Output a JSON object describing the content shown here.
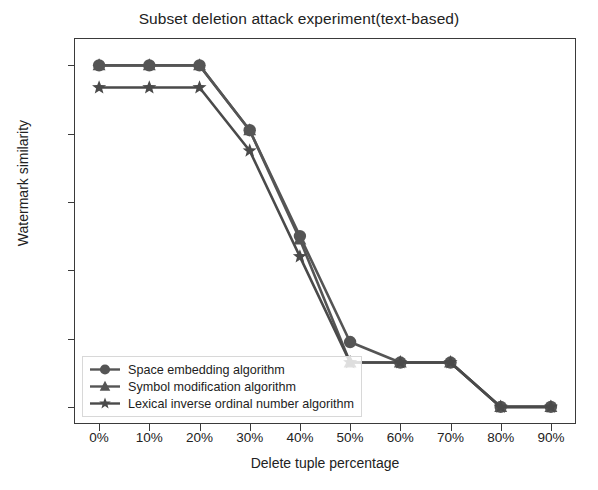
{
  "chart_data": {
    "type": "line",
    "title": "Subset deletion attack experiment(text-based)",
    "xlabel": "Delete tuple percentage",
    "ylabel": "Watermark similarity",
    "categories": [
      "0%",
      "10%",
      "20%",
      "30%",
      "40%",
      "50%",
      "60%",
      "70%",
      "80%",
      "90%"
    ],
    "x": [
      0,
      10,
      20,
      30,
      40,
      50,
      60,
      70,
      80,
      90
    ],
    "xlim": [
      -5,
      95
    ],
    "ylim": [
      -0.05,
      1.08
    ],
    "yticks": [
      0.0,
      0.2,
      0.4,
      0.6,
      0.8,
      1.0
    ],
    "ytick_labels": [
      "0.0",
      "0.2",
      "0.4",
      "0.6",
      "0.8",
      "1.0"
    ],
    "grid": false,
    "legend_position": "lower left",
    "series": [
      {
        "name": "Space embedding algorithm",
        "marker": "circle",
        "color": "#555555",
        "values": [
          1.0,
          1.0,
          1.0,
          0.81,
          0.5,
          0.19,
          0.13,
          0.13,
          0.0,
          0.0
        ]
      },
      {
        "name": "Symbol modification algorithm",
        "marker": "triangle-up",
        "color": "#555555",
        "values": [
          1.0,
          1.0,
          1.0,
          0.81,
          0.49,
          0.13,
          0.13,
          0.13,
          0.0,
          0.0
        ]
      },
      {
        "name": "Lexical inverse ordinal number algorithm",
        "marker": "star",
        "color": "#4a4a4a",
        "values": [
          0.935,
          0.935,
          0.935,
          0.75,
          0.44,
          0.13,
          0.13,
          0.13,
          0.0,
          0.0
        ]
      }
    ]
  },
  "legend": {
    "items": [
      {
        "label": "Space embedding algorithm",
        "marker": "circle"
      },
      {
        "label": "Symbol modification algorithm",
        "marker": "triangle-up"
      },
      {
        "label": "Lexical inverse ordinal number algorithm",
        "marker": "star"
      }
    ]
  },
  "colors": {
    "line": "#555555",
    "axis": "#3a3a3a",
    "text": "#222222",
    "background": "#ffffff"
  }
}
